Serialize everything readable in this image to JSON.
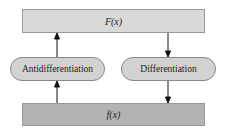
{
  "top_box": {
    "label": "F(x)"
  },
  "bottom_box": {
    "label": "f(x)"
  },
  "left_process": {
    "label": "Antidifferentiation",
    "direction": "up"
  },
  "right_process": {
    "label": "Differentiation",
    "direction": "down"
  }
}
